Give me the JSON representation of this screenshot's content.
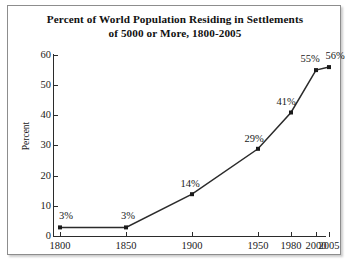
{
  "figure": {
    "title_line1": "Percent of World Population Residing in Settlements",
    "title_line2": "of 5000 or More, 1800-2005"
  },
  "chart_data": {
    "type": "line",
    "title": "Percent of World Population Residing in Settlements of 5000 or More, 1800-2005",
    "xlabel": "",
    "ylabel": "Percent",
    "x": [
      1800,
      1850,
      1900,
      1950,
      1980,
      2000,
      2005
    ],
    "categories": [
      "1800",
      "1850",
      "1900",
      "1950",
      "1980",
      "2000",
      "2005"
    ],
    "values": [
      3,
      3,
      14,
      29,
      41,
      55,
      56
    ],
    "point_labels": [
      "3%",
      "3%",
      "14%",
      "29%",
      "41%",
      "55%",
      "56%"
    ],
    "ylim": [
      0,
      60
    ],
    "yticks": [
      0,
      10,
      20,
      30,
      40,
      50,
      60
    ],
    "ytick_labels": [
      "0",
      "10",
      "20",
      "30",
      "40",
      "50",
      "60"
    ],
    "xtick_labels": [
      "1800",
      "1850",
      "1900",
      "1950",
      "1980",
      "2000",
      "2005"
    ],
    "grid": false,
    "legend": "none",
    "series_color": "#2b2b2b",
    "marker": "square",
    "marker_color": "#1a1a1a"
  }
}
